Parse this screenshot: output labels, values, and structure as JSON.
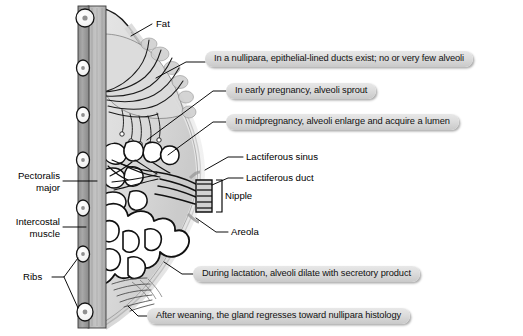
{
  "figure": {
    "background_color": "#ffffff",
    "callout_fill": "#dcdcdc",
    "ink_color": "#000000"
  },
  "callouts": [
    {
      "id": "nullipara",
      "text": "In a nullipara, epithelial-lined ducts exist; no or very few alveoli"
    },
    {
      "id": "early",
      "text": "In early pregnancy, alveoli sprout"
    },
    {
      "id": "midpregnancy",
      "text": "In midpregnancy, alveoli enlarge and acquire a lumen"
    },
    {
      "id": "lactation",
      "text": "During lactation, alveoli dilate with secretory product"
    },
    {
      "id": "weaning",
      "text": "After weaning, the gland regresses toward nullipara histology"
    }
  ],
  "labels": [
    {
      "id": "fat",
      "text": "Fat"
    },
    {
      "id": "lactiferous-sinus",
      "text": "Lactiferous sinus"
    },
    {
      "id": "lactiferous-duct",
      "text": "Lactiferous duct"
    },
    {
      "id": "nipple",
      "text": "Nipple"
    },
    {
      "id": "areola",
      "text": "Areola"
    },
    {
      "id": "ribs",
      "text": "Ribs"
    }
  ],
  "labels_multiline": [
    {
      "id": "pectoralis-major",
      "line1": "Pectoralis",
      "line2": "major"
    },
    {
      "id": "intercostal-muscle",
      "line1": "Intercostal",
      "line2": "muscle"
    }
  ]
}
